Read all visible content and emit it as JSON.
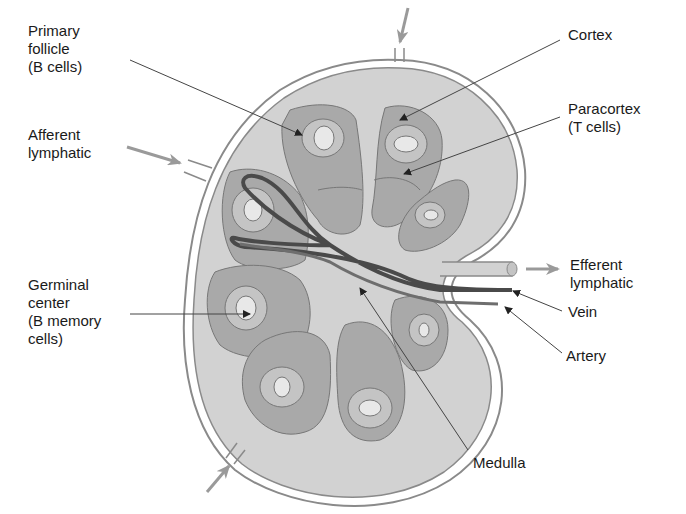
{
  "diagram": {
    "colors": {
      "capsule_outline": "#8a8a8a",
      "node_fill": "#d2d2d2",
      "lobule_fill": "#a9a9a9",
      "germinal_ring": "#c4c4c4",
      "germinal_center": "#e8e8e8",
      "vein": "#4a4a4a",
      "artery": "#6e6e6e",
      "flow_arrow": "#9a9a9a",
      "leader_line": "#444444"
    },
    "labels": {
      "primary_follicle": [
        "Primary",
        "follicle",
        "(B cells)"
      ],
      "afferent_lymphatic": [
        "Afferent",
        "lymphatic"
      ],
      "germinal_center": [
        "Germinal",
        "center",
        "(B memory",
        "cells)"
      ],
      "cortex": [
        "Cortex"
      ],
      "paracortex": [
        "Paracortex",
        "(T cells)"
      ],
      "efferent_lymphatic": [
        "Efferent",
        "lymphatic"
      ],
      "vein": [
        "Vein"
      ],
      "artery": [
        "Artery"
      ],
      "medulla": [
        "Medulla"
      ]
    }
  }
}
